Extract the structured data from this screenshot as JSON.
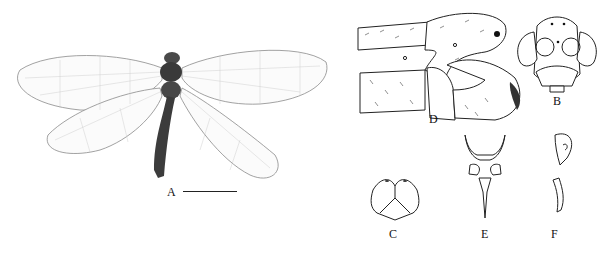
{
  "figure": {
    "panels": [
      {
        "id": "A",
        "label": "A",
        "content": "habitus photograph, dorsal view",
        "has_scale_bar": true
      },
      {
        "id": "B",
        "label": "B",
        "content": "head, frontal view"
      },
      {
        "id": "C",
        "label": "C",
        "content": "structure C"
      },
      {
        "id": "D",
        "label": "D",
        "content": "terminalia, lateral view"
      },
      {
        "id": "E",
        "label": "E",
        "content": "structure E"
      },
      {
        "id": "F",
        "label": "F",
        "content": "structure F, lateral"
      }
    ],
    "colors": {
      "background": "#ffffff",
      "ink": "#222222",
      "body": "#3a3a3a"
    }
  }
}
